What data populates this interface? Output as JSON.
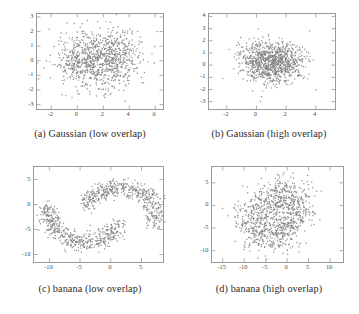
{
  "figure": {
    "layout": "2x2 grid of scatter plots",
    "background_color": "#ffffff",
    "marker_color": "#808080",
    "axis_color": "#9a9a9a",
    "caption_color": "#2b2b2b"
  },
  "chart_data": [
    {
      "type": "scatter",
      "panel": "a",
      "title": "(a) Gaussian (low overlap)",
      "xlabel": "",
      "ylabel": "",
      "xlim": [
        -3.1,
        6.6
      ],
      "ylim": [
        -3.3,
        3.2
      ],
      "xticks": [
        -2,
        0,
        2,
        4,
        6
      ],
      "yticks": [
        -3,
        -2,
        -1,
        0,
        1,
        2,
        3
      ],
      "xtick_labels": [
        "-2",
        "0",
        "2",
        "4",
        "6"
      ],
      "ytick_labels": [
        "-3",
        "-2",
        "-1",
        "0",
        "1",
        "2",
        "3"
      ],
      "grid": false,
      "legend": null,
      "marker_color": "#808080",
      "marker_size": 1.3,
      "n_points": 1000,
      "series": [
        {
          "name": "class 1",
          "distribution": "gaussian",
          "mean": [
            0.55,
            -0.05
          ],
          "std": [
            1.05,
            0.95
          ],
          "n": 500
        },
        {
          "name": "class 2",
          "distribution": "gaussian",
          "mean": [
            2.85,
            0.2
          ],
          "std": [
            1.05,
            0.95
          ],
          "n": 500
        }
      ]
    },
    {
      "type": "scatter",
      "panel": "b",
      "title": "(b) Gaussian (high overlap)",
      "xlabel": "",
      "ylabel": "",
      "xlim": [
        -3.2,
        5.3
      ],
      "ylim": [
        -3.6,
        4.2
      ],
      "xticks": [
        -2,
        0,
        2,
        4
      ],
      "yticks": [
        -3,
        -2,
        -1,
        0,
        1,
        2,
        3,
        4
      ],
      "xtick_labels": [
        "-2",
        "0",
        "2",
        "4"
      ],
      "ytick_labels": [
        "-3",
        "-2",
        "-1",
        "0",
        "1",
        "2",
        "3",
        "4"
      ],
      "grid": false,
      "legend": null,
      "marker_color": "#808080",
      "marker_size": 1.3,
      "n_points": 1000,
      "series": [
        {
          "name": "class 1",
          "distribution": "gaussian",
          "mean": [
            0.6,
            0.25
          ],
          "std": [
            0.95,
            0.85
          ],
          "n": 500
        },
        {
          "name": "class 2",
          "distribution": "gaussian",
          "mean": [
            1.5,
            0.25
          ],
          "std": [
            0.95,
            0.85
          ],
          "n": 500
        }
      ]
    },
    {
      "type": "scatter",
      "panel": "c",
      "title": "(c) banana (low overlap)",
      "xlabel": "",
      "ylabel": "",
      "xlim": [
        -12.5,
        8.5
      ],
      "ylim": [
        -11.5,
        7.5
      ],
      "xticks": [
        -10,
        -5,
        0,
        5
      ],
      "yticks": [
        -10,
        -5,
        0,
        5
      ],
      "xtick_labels": [
        "-10",
        "-5",
        "0",
        "5"
      ],
      "ytick_labels": [
        "-10",
        "-5",
        "0",
        "5"
      ],
      "grid": false,
      "legend": null,
      "marker_color": "#808080",
      "marker_size": 1.3,
      "n_points": 1000,
      "series": [
        {
          "name": "banana 1",
          "distribution": "banana",
          "center": [
            -4.2,
            -1.6
          ],
          "radius": 6.0,
          "angle_start": 2.95,
          "angle_end": 5.95,
          "noise": 1.25,
          "n": 500
        },
        {
          "name": "banana 2",
          "distribution": "banana",
          "center": [
            1.5,
            -2.6
          ],
          "radius": 6.0,
          "angle_start": -0.25,
          "angle_end": 2.75,
          "noise": 1.25,
          "n": 500
        }
      ]
    },
    {
      "type": "scatter",
      "panel": "d",
      "title": "(d) banana (high overlap)",
      "xlabel": "",
      "ylabel": "",
      "xlim": [
        -17.5,
        13.0
      ],
      "ylim": [
        -12.5,
        8.5
      ],
      "xticks": [
        -15,
        -10,
        -5,
        0,
        5,
        10
      ],
      "yticks": [
        -10,
        -5,
        0,
        5
      ],
      "xtick_labels": [
        "-15",
        "-10",
        "-5",
        "0",
        "5",
        "10"
      ],
      "ytick_labels": [
        "-10",
        "-5",
        "0",
        "5"
      ],
      "grid": false,
      "legend": null,
      "marker_color": "#808080",
      "marker_size": 1.3,
      "n_points": 1000,
      "series": [
        {
          "name": "banana 1",
          "distribution": "banana",
          "center": [
            -4.0,
            -2.0
          ],
          "radius": 5.0,
          "angle_start": 2.9,
          "angle_end": 6.0,
          "noise": 3.1,
          "n": 500
        },
        {
          "name": "banana 2",
          "distribution": "banana",
          "center": [
            -1.5,
            -2.6
          ],
          "radius": 5.0,
          "angle_start": -0.2,
          "angle_end": 2.8,
          "noise": 3.1,
          "n": 500
        }
      ]
    }
  ],
  "captions": {
    "a": "(a) Gaussian (low overlap)",
    "b": "(b) Gaussian (high overlap)",
    "c": "(c) banana (low overlap)",
    "d": "(d) banana (high overlap)"
  }
}
